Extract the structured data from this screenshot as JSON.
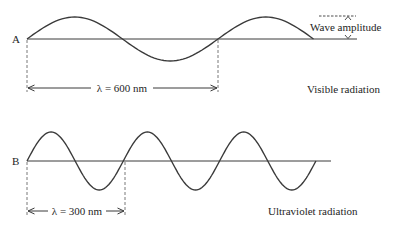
{
  "diagram": {
    "colors": {
      "ink": "#3a3a3a",
      "text": "#1e1e1e",
      "background": "#ffffff"
    },
    "waves": [
      {
        "id": "A",
        "label": "A",
        "wavelength_label": "λ = 600 nm",
        "wavelength_nm": 600,
        "radiation_label": "Visible radiation",
        "cycles_shown": 1.5,
        "amplitude_label": "Wave amplitude"
      },
      {
        "id": "B",
        "label": "B",
        "wavelength_label": "λ = 300 nm",
        "wavelength_nm": 300,
        "radiation_label": "Ultraviolet radiation",
        "cycles_shown": 3
      }
    ]
  }
}
